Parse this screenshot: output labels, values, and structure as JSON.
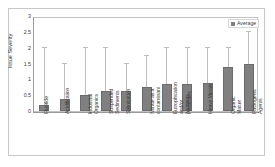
{
  "chart_data": {
    "type": "bar",
    "title": "",
    "xlabel": "",
    "ylabel": "Issue Severity",
    "ylim": [
      0,
      3
    ],
    "yticks": [
      0,
      0.5,
      1,
      1.5,
      2,
      2.5,
      3
    ],
    "ytick_labels": [
      "0",
      "0.5",
      "1",
      "1.5",
      "2",
      "2.5",
      "3"
    ],
    "grid": false,
    "legend_position": "top-right",
    "legend": [
      "Average"
    ],
    "categories": [
      "Fluoride",
      "Acidification",
      "Industrial Organics",
      "Suspended Sediments",
      "Salinization",
      "Nitrate as a contaminant",
      "Eutrophication and/or Nutrients",
      "Pesticides",
      "Heavy Metals",
      "Organic Matter",
      "Pathogenic Agents"
    ],
    "series": [
      {
        "name": "Average",
        "values": [
          0.19,
          0.37,
          0.5,
          0.62,
          0.62,
          0.75,
          0.84,
          0.84,
          0.89,
          1.4,
          1.5
        ],
        "error_high": [
          2.0,
          1.5,
          2.0,
          2.0,
          1.5,
          1.75,
          2.0,
          2.0,
          2.0,
          2.0,
          2.5
        ]
      }
    ],
    "colors": {
      "bar": "#808080",
      "error": "#bdbdbd",
      "axis": "#9a9a9a",
      "text": "#3a3a3a",
      "frame": "#c8c8c8",
      "background": "#ffffff"
    }
  },
  "legend": {
    "label": "Average"
  },
  "axis": {
    "y_title": "Issue Severity"
  }
}
